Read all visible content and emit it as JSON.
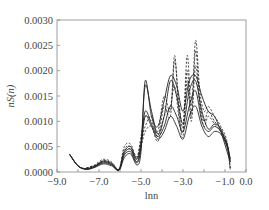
{
  "chart_data": {
    "type": "line",
    "title": "",
    "xlabel": "lnn",
    "ylabel": "nS(n)",
    "xlim": [
      -9.0,
      0.0
    ],
    "ylim": [
      0.0,
      0.003
    ],
    "grid": false,
    "legend": null,
    "x_ticks": [
      -9.0,
      -8.0,
      -7.0,
      -6.0,
      -5.0,
      -4.0,
      -3.0,
      -2.0,
      -1.0,
      0.0
    ],
    "x_tick_labels": [
      "-9.0",
      "",
      "-7.0",
      "",
      "-5.0",
      "",
      "-3.0",
      "",
      "-1.0",
      "0.0"
    ],
    "y_ticks": [
      0.0,
      0.0005,
      0.001,
      0.0015,
      0.002,
      0.0025,
      0.003
    ],
    "y_tick_labels": [
      "0.0000",
      "0.0005",
      "0.0010",
      "0.0015",
      "0.0020",
      "0.0025",
      "0.0030"
    ],
    "series": [
      {
        "name": "solid-1",
        "style": "solid",
        "x": [
          -8.4,
          -8.0,
          -7.6,
          -7.2,
          -6.8,
          -6.4,
          -6.05,
          -5.8,
          -5.5,
          -5.2,
          -5.0,
          -4.8,
          -4.5,
          -4.2,
          -3.9,
          -3.6,
          -3.3,
          -3.0,
          -2.7,
          -2.4,
          -2.1,
          -1.8,
          -1.5,
          -1.2,
          -0.9,
          -0.75
        ],
        "y": [
          0.00035,
          0.00012,
          5e-05,
          9e-05,
          0.00016,
          0.00012,
          3e-05,
          0.00028,
          0.00036,
          0.00014,
          0.0004,
          0.0018,
          0.0011,
          0.0009,
          0.0014,
          0.0019,
          0.0017,
          0.0012,
          0.0018,
          0.0019,
          0.0015,
          0.0012,
          0.0011,
          0.0008,
          0.0004,
          0.0002
        ]
      },
      {
        "name": "solid-2",
        "style": "solid",
        "x": [
          -8.4,
          -8.0,
          -7.6,
          -7.2,
          -6.8,
          -6.4,
          -6.05,
          -5.8,
          -5.5,
          -5.2,
          -5.0,
          -4.8,
          -4.5,
          -4.2,
          -3.9,
          -3.6,
          -3.3,
          -3.0,
          -2.7,
          -2.4,
          -2.1,
          -1.8,
          -1.5,
          -1.2,
          -0.9,
          -0.75
        ],
        "y": [
          0.00035,
          0.00012,
          6e-05,
          0.0001,
          0.00018,
          0.00014,
          4e-05,
          0.00033,
          0.0004,
          0.00018,
          0.0005,
          0.0017,
          0.0012,
          0.00075,
          0.0011,
          0.0018,
          0.0015,
          0.00095,
          0.0016,
          0.0018,
          0.0012,
          0.00085,
          0.00095,
          0.00085,
          0.0005,
          0.0002
        ]
      },
      {
        "name": "solid-3",
        "style": "solid",
        "x": [
          -8.4,
          -8.0,
          -7.6,
          -7.2,
          -6.8,
          -6.4,
          -6.05,
          -5.8,
          -5.5,
          -5.2,
          -5.0,
          -4.8,
          -4.5,
          -4.2,
          -3.9,
          -3.6,
          -3.3,
          -3.0,
          -2.7,
          -2.4,
          -2.1,
          -1.8,
          -1.5,
          -1.2,
          -0.9,
          -0.75
        ],
        "y": [
          0.00035,
          0.00012,
          6e-05,
          0.00011,
          0.0002,
          0.00015,
          4e-05,
          0.00036,
          0.00045,
          0.0002,
          0.0005,
          0.0011,
          0.0009,
          0.00065,
          0.0008,
          0.0011,
          0.0009,
          0.00065,
          0.0011,
          0.0013,
          0.0009,
          0.0007,
          0.0008,
          0.00075,
          0.0005,
          0.00025
        ]
      },
      {
        "name": "solid-4",
        "style": "solid",
        "x": [
          -8.4,
          -8.0,
          -7.6,
          -7.2,
          -6.8,
          -6.4,
          -6.05,
          -5.8,
          -5.5,
          -5.2,
          -5.0,
          -4.8,
          -4.5,
          -4.2,
          -3.9,
          -3.6,
          -3.3,
          -3.0,
          -2.7,
          -2.4,
          -2.1,
          -1.8,
          -1.5,
          -1.2,
          -0.9,
          -0.75
        ],
        "y": [
          0.00035,
          0.00012,
          7e-05,
          0.00012,
          0.00022,
          0.00017,
          5e-05,
          0.0004,
          0.0005,
          0.00025,
          0.0006,
          0.0012,
          0.00095,
          0.0007,
          0.0009,
          0.0013,
          0.0011,
          0.0008,
          0.0013,
          0.0016,
          0.001,
          0.0008,
          0.0009,
          0.0008,
          0.00055,
          0.00025
        ]
      },
      {
        "name": "dashed-1",
        "style": "dashed",
        "x": [
          -7.6,
          -7.2,
          -6.8,
          -6.4,
          -6.05,
          -5.8,
          -5.5,
          -5.2,
          -5.0,
          -4.8,
          -4.5,
          -4.2,
          -3.9,
          -3.6,
          -3.4,
          -3.2,
          -3.0,
          -2.8,
          -2.6,
          -2.4,
          -2.2,
          -2.0,
          -1.8,
          -1.5,
          -1.2,
          -0.9,
          -0.75
        ],
        "y": [
          8e-05,
          0.00014,
          0.00025,
          0.0002,
          6e-05,
          0.0005,
          0.00055,
          0.0003,
          0.0007,
          0.0011,
          0.001,
          0.0008,
          0.0015,
          0.0012,
          0.0022,
          0.0014,
          0.0009,
          0.0023,
          0.0013,
          0.0026,
          0.0016,
          0.0012,
          0.0013,
          0.0011,
          0.0009,
          0.0006,
          5e-05
        ]
      },
      {
        "name": "dashed-2",
        "style": "dashed",
        "x": [
          -7.6,
          -7.2,
          -6.8,
          -6.4,
          -6.05,
          -5.8,
          -5.5,
          -5.2,
          -5.0,
          -4.8,
          -4.5,
          -4.2,
          -3.9,
          -3.6,
          -3.4,
          -3.2,
          -3.0,
          -2.8,
          -2.6,
          -2.4,
          -2.2,
          -2.0,
          -1.8,
          -1.5,
          -1.2,
          -0.9,
          -0.75
        ],
        "y": [
          8e-05,
          0.00013,
          0.00022,
          0.00018,
          5e-05,
          0.00045,
          0.0005,
          0.00028,
          0.0006,
          0.0009,
          0.0011,
          0.0007,
          0.0013,
          0.0011,
          0.0023,
          0.0012,
          0.0008,
          0.002,
          0.0011,
          0.0024,
          0.0014,
          0.001,
          0.0012,
          0.001,
          0.00085,
          0.00055,
          5e-05
        ]
      },
      {
        "name": "dashed-3",
        "style": "dashed",
        "x": [
          -7.6,
          -7.2,
          -6.8,
          -6.4,
          -6.05,
          -5.8,
          -5.5,
          -5.2,
          -5.0,
          -4.8,
          -4.5,
          -4.2,
          -3.9,
          -3.6,
          -3.4,
          -3.2,
          -3.0,
          -2.8,
          -2.6,
          -2.4,
          -2.2,
          -2.0,
          -1.8,
          -1.5,
          -1.2,
          -0.9,
          -0.75
        ],
        "y": [
          7e-05,
          0.00012,
          0.0002,
          0.00016,
          5e-05,
          0.0004,
          0.00045,
          0.00026,
          0.0005,
          0.0008,
          0.0009,
          0.0006,
          0.0011,
          0.0013,
          0.0017,
          0.0011,
          0.0007,
          0.0018,
          0.001,
          0.0021,
          0.0013,
          0.0009,
          0.0011,
          0.00095,
          0.0008,
          0.0005,
          8e-05
        ]
      }
    ]
  }
}
